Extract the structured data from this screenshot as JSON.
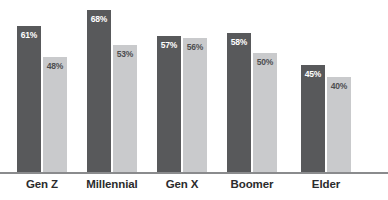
{
  "chart_data": {
    "type": "bar",
    "title": "",
    "subtitle": "",
    "xlabel": "",
    "ylabel": "",
    "ylim": [
      0,
      72
    ],
    "grid": false,
    "legend_position": "none",
    "value_suffix": "%",
    "categories": [
      "Gen Z",
      "Millennial",
      "Gen X",
      "Boomer",
      "Elder"
    ],
    "series": [
      {
        "name": "Series 1",
        "color": "#58595b",
        "label_color": "#ffffff",
        "values": [
          61,
          68,
          57,
          58,
          45
        ],
        "labels": [
          "61%",
          "68%",
          "57%",
          "58%",
          "45%"
        ]
      },
      {
        "name": "Series 2",
        "color": "#c9cacc",
        "label_color": "#4d4e50",
        "values": [
          48,
          53,
          56,
          50,
          40
        ],
        "labels": [
          "48%",
          "53%",
          "56%",
          "50%",
          "40%"
        ]
      }
    ]
  },
  "axis": {
    "baseline_color": "#8a8b8d"
  },
  "groups": [
    {
      "label": "Gen Z",
      "left": 17,
      "label_left": 0,
      "label_width": 84,
      "bars": [
        {
          "value_label": "61%",
          "height_pct": 84.7
        },
        {
          "value_label": "48%",
          "height_pct": 66.6
        }
      ]
    },
    {
      "label": "Millennial",
      "left": 87,
      "label_left": 70,
      "label_width": 84,
      "bars": [
        {
          "value_label": "68%",
          "height_pct": 94.4
        },
        {
          "value_label": "53%",
          "height_pct": 73.6
        }
      ]
    },
    {
      "label": "Gen X",
      "left": 157,
      "label_left": 140,
      "label_width": 84,
      "bars": [
        {
          "value_label": "57%",
          "height_pct": 79.2
        },
        {
          "value_label": "56%",
          "height_pct": 77.8
        }
      ]
    },
    {
      "label": "Boomer",
      "left": 227,
      "label_left": 210,
      "label_width": 84,
      "bars": [
        {
          "value_label": "58%",
          "height_pct": 80.6
        },
        {
          "value_label": "50%",
          "height_pct": 69.4
        }
      ]
    },
    {
      "label": "Elder",
      "left": 301,
      "label_left": 284,
      "label_width": 84,
      "bars": [
        {
          "value_label": "45%",
          "height_pct": 62.5
        },
        {
          "value_label": "40%",
          "height_pct": 55.5
        }
      ]
    }
  ]
}
